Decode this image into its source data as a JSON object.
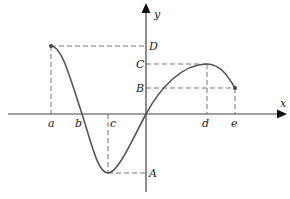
{
  "diagram": {
    "type": "function-graph",
    "axes": {
      "x_label": "x",
      "y_label": "y"
    },
    "x_ticks": [
      {
        "label": "a",
        "px": 51
      },
      {
        "label": "b",
        "px": 82
      },
      {
        "label": "c",
        "px": 108
      },
      {
        "label": "d",
        "px": 207
      },
      {
        "label": "e",
        "px": 235
      }
    ],
    "y_ticks": [
      {
        "label": "D",
        "py": 46
      },
      {
        "label": "C",
        "py": 64
      },
      {
        "label": "B",
        "py": 88
      },
      {
        "label": "A",
        "py": 173
      }
    ],
    "key_points": [
      {
        "name": "start",
        "x": "a",
        "y": "D"
      },
      {
        "name": "zero",
        "x": "b",
        "y": "0"
      },
      {
        "name": "minimum",
        "x": "c",
        "y": "A"
      },
      {
        "name": "origin",
        "x": "0",
        "y": "0"
      },
      {
        "name": "maximum",
        "x": "d",
        "y": "C"
      },
      {
        "name": "end",
        "x": "e",
        "y": "B"
      }
    ],
    "colors": {
      "curve": "#555555",
      "axis": "#444444",
      "dash": "#777777"
    }
  }
}
